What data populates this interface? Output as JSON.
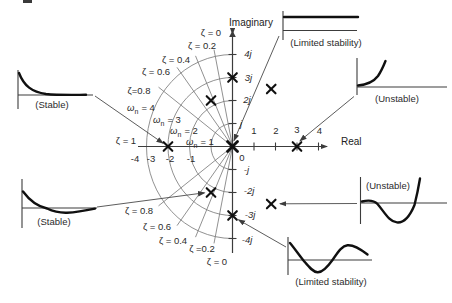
{
  "splane": {
    "imaginary_axis_label": "Imaginary",
    "real_axis_label": "Real",
    "origin_label": "0",
    "imag_ticks": [
      "4j",
      "3j",
      "2j",
      "j",
      "-j",
      "-2j",
      "-3j",
      "-4j"
    ],
    "real_ticks_positive": [
      "1",
      "2",
      "3",
      "4"
    ],
    "real_ticks_negative": [
      "-4",
      "-3",
      "-2",
      "-1"
    ],
    "zeta_labels_upper": [
      "ζ = 0",
      "ζ = 0.2",
      "ζ = 0.4",
      "ζ = 0.6",
      "ζ=0.8",
      "ζ = 1"
    ],
    "zeta_labels_lower": [
      "ζ = 0.8",
      "ζ = 0.6",
      "ζ = 0.4",
      "ζ =0.2",
      "ζ = 0"
    ],
    "omega_labels": [
      {
        "symbol": "ω",
        "subscript": "n",
        "value": "= 4"
      },
      {
        "symbol": "ω",
        "subscript": "n",
        "value": "= 3"
      },
      {
        "symbol": "ω",
        "subscript": "n",
        "value": "= 2"
      },
      {
        "symbol": "ω",
        "subscript": "n",
        "value": "= 1"
      }
    ],
    "grid": {
      "omega_circles": [
        1,
        2,
        3,
        4
      ],
      "zeta_rays": [
        0.2,
        0.4,
        0.6,
        0.8
      ]
    },
    "poles": [
      {
        "re": 0,
        "im": 0,
        "bold": true
      },
      {
        "re": -3,
        "im": 0
      },
      {
        "re": 3,
        "im": 0
      },
      {
        "re": 0,
        "im": 3
      },
      {
        "re": 0,
        "im": -3
      },
      {
        "re": -1,
        "im": 2
      },
      {
        "re": -1,
        "im": -2
      },
      {
        "re": 1.8,
        "im": 2.5
      },
      {
        "re": 1.8,
        "im": -2.5
      }
    ]
  },
  "response_plots": [
    {
      "id": "top-left",
      "label": "(Stable)",
      "shape": "exponential-decay",
      "pole": {
        "re": -3,
        "im": 0
      }
    },
    {
      "id": "top-center",
      "label": "(Limited stability)",
      "shape": "constant-step",
      "pole": {
        "re": 0,
        "im": 0
      }
    },
    {
      "id": "top-right",
      "label": "(Unstable)",
      "shape": "exponential-growth",
      "pole": {
        "re": 3,
        "im": 0
      }
    },
    {
      "id": "bottom-left",
      "label": "(Stable)",
      "shape": "damped-oscillation",
      "pole": {
        "re": -1,
        "im": -2
      }
    },
    {
      "id": "bottom-right",
      "label": "(Unstable)",
      "shape": "growing-oscillation",
      "pole": {
        "re": 1.8,
        "im": -2.5
      }
    },
    {
      "id": "bottom-center",
      "label": "(Limited stability)",
      "shape": "sustained-oscillation",
      "pole": {
        "re": 0,
        "im": -3
      }
    }
  ],
  "colors": {
    "ink": "#2b2b2b",
    "axis": "#3c3c3c",
    "grid": "#757575",
    "curve": "#101010",
    "connector": "#4a4a4a",
    "background": "#ffffff"
  }
}
